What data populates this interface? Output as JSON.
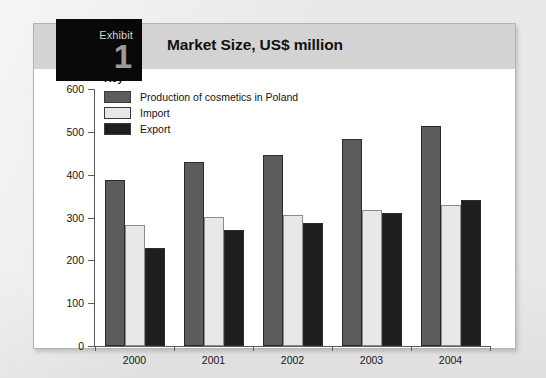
{
  "exhibit": {
    "label": "Exhibit",
    "number": "1",
    "title": "Market Size, US$ million"
  },
  "legend": {
    "title": "Key",
    "entries": [
      {
        "label": "Production of cosmetics in Poland",
        "color": "#5c5c5c"
      },
      {
        "label": "Import",
        "color": "#e8e8e8"
      },
      {
        "label": "Export",
        "color": "#1e1e1e"
      }
    ]
  },
  "axes": {
    "y_ticks": [
      "600",
      "500",
      "400",
      "300",
      "200",
      "100",
      "0"
    ],
    "x_labels": [
      "2000",
      "2001",
      "2002",
      "2003",
      "2004"
    ]
  },
  "chart_data": {
    "type": "bar",
    "title": "Market Size, US$ million",
    "xlabel": "",
    "ylabel": "",
    "ylim": [
      0,
      600
    ],
    "ytick_step": 100,
    "grid": false,
    "legend_position": "top-left-inside",
    "categories": [
      "2000",
      "2001",
      "2002",
      "2003",
      "2004"
    ],
    "series": [
      {
        "name": "Production of cosmetics in Poland",
        "color": "#5c5c5c",
        "values": [
          388,
          430,
          447,
          484,
          513
        ]
      },
      {
        "name": "Import",
        "color": "#e8e8e8",
        "values": [
          282,
          302,
          307,
          318,
          330
        ]
      },
      {
        "name": "Export",
        "color": "#1e1e1e",
        "values": [
          229,
          270,
          288,
          311,
          340
        ]
      }
    ]
  },
  "colors": {
    "page_background": "#eaeaea",
    "panel_background": "#ffffff",
    "header_band": "#d3d3d3",
    "exhibit_box": "#080808",
    "axis": "#5a5a5a"
  }
}
